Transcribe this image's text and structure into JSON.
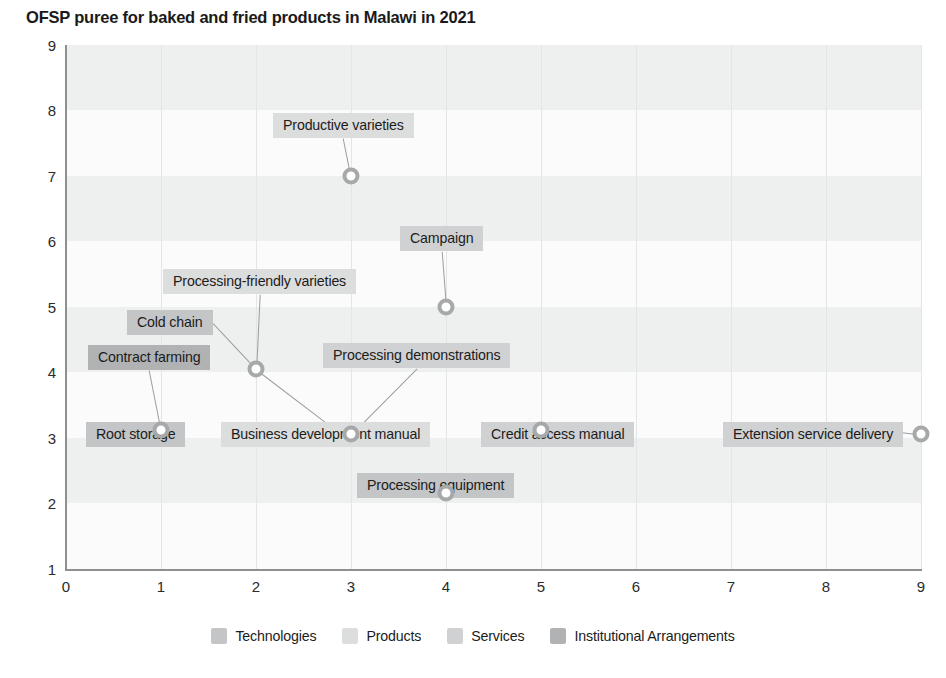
{
  "chart_data": {
    "type": "scatter",
    "title": "OFSP puree for baked and fried products in Malawi in 2021",
    "xlabel": "",
    "ylabel": "",
    "xlim": [
      0,
      9
    ],
    "ylim": [
      0,
      9
    ],
    "x_ticks": [
      "0",
      "1",
      "2",
      "3",
      "4",
      "5",
      "6",
      "7",
      "8",
      "9"
    ],
    "y_ticks": [
      "1",
      "2",
      "3",
      "4",
      "5",
      "6",
      "7",
      "8",
      "9"
    ],
    "grid": "horizontal-bands-and-vertical-lines",
    "legend_position": "bottom-center",
    "legend": [
      {
        "label": "Technologies",
        "color": "#c3c5c6"
      },
      {
        "label": "Products",
        "color": "#dcdddd"
      },
      {
        "label": "Services",
        "color": "#d0d1d2"
      },
      {
        "label": "Institutional Arrangements",
        "color": "#b0b2b4"
      }
    ],
    "points": [
      {
        "label": "Productive varieties",
        "x": 3,
        "y": 7.0,
        "category": "Products"
      },
      {
        "label": "Campaign",
        "x": 4,
        "y": 5.0,
        "category": "Services"
      },
      {
        "label": "Processing-friendly varieties",
        "x": 2,
        "y": 4.05,
        "category": "Products"
      },
      {
        "label": "Cold chain",
        "x": 2,
        "y": 4.05,
        "category": "Technologies"
      },
      {
        "label": "Business development manual",
        "x": 2,
        "y": 4.05,
        "category": "Products"
      },
      {
        "label": "Contract farming",
        "x": 1,
        "y": 3.12,
        "category": "Institutional Arrangements"
      },
      {
        "label": "Root storage",
        "x": 1,
        "y": 3.12,
        "category": "Technologies"
      },
      {
        "label": "Processing demonstrations",
        "x": 3,
        "y": 3.05,
        "category": "Services"
      },
      {
        "label": "Credit access manual",
        "x": 5,
        "y": 3.12,
        "category": "Services"
      },
      {
        "label": "Extension service delivery",
        "x": 9,
        "y": 3.05,
        "category": "Services"
      },
      {
        "label": "Processing equipment",
        "x": 4,
        "y": 2.15,
        "category": "Technologies"
      }
    ]
  }
}
